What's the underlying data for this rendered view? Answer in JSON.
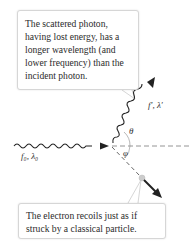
{
  "callouts": {
    "scattered_photon": "The scattered photon, having lost energy, has a longer wavelength (and lower frequency) than the incident photon.",
    "electron_recoil": "The electron recoils just as if struck by a classical particle."
  },
  "labels": {
    "incident_photon": "f₀, λ₀",
    "scattered_photon": "f′, λ′",
    "theta": "θ",
    "phi": "φ"
  },
  "colors": {
    "wave": "#222222",
    "dashed": "#888888",
    "callout_border": "#d6d6d6",
    "electron": "#cccccc"
  }
}
